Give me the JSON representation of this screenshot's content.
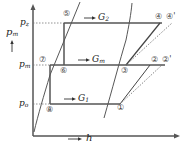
{
  "diagram": {
    "type": "p-h diagram (two-stage refrigeration cycle)",
    "axes": {
      "y_label": "p",
      "y_label_sub": "m",
      "x_label": "h"
    },
    "pressure_levels": [
      {
        "name": "p_z",
        "label": "p",
        "sub": "z"
      },
      {
        "name": "p_m",
        "label": "p",
        "sub": "m"
      },
      {
        "name": "p_o",
        "label": "p",
        "sub": "o"
      }
    ],
    "flows": [
      {
        "label": "G",
        "sub": "2"
      },
      {
        "label": "G",
        "sub": "m"
      },
      {
        "label": "G",
        "sub": "1"
      }
    ],
    "points": {
      "p1": "①",
      "p2": "②",
      "p2s": "②'",
      "p3": "③",
      "p4": "④",
      "p4s": "④'",
      "p5": "⑤",
      "p6": "⑥",
      "p7": "⑦",
      "p8": "⑧"
    },
    "colors": {
      "line": "#555555",
      "dotted": "#777777",
      "text": "#222222"
    }
  }
}
